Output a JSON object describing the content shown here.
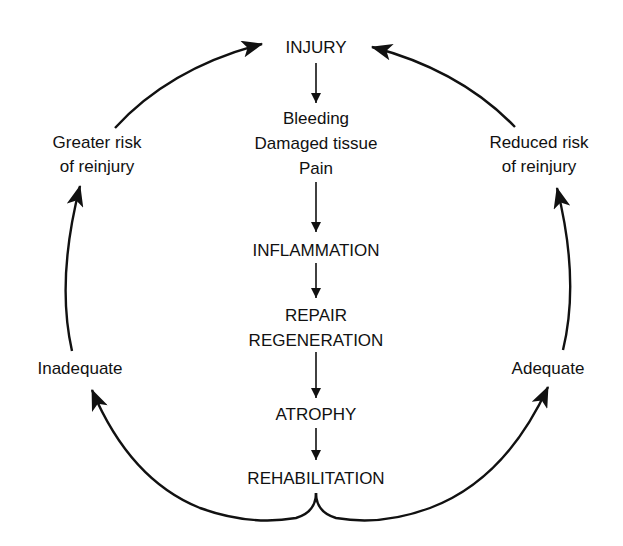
{
  "diagram": {
    "type": "cycle-flowchart",
    "colors": {
      "line": "#111111",
      "text": "#111111",
      "background": "#ffffff"
    },
    "center_flow": [
      {
        "id": "injury",
        "lines": [
          "INJURY"
        ]
      },
      {
        "id": "effects",
        "lines": [
          "Bleeding",
          "Damaged tissue",
          "Pain"
        ]
      },
      {
        "id": "inflammation",
        "lines": [
          "INFLAMMATION"
        ]
      },
      {
        "id": "repair",
        "lines": [
          "REPAIR",
          "REGENERATION"
        ]
      },
      {
        "id": "atrophy",
        "lines": [
          "ATROPHY"
        ]
      },
      {
        "id": "rehabilitation",
        "lines": [
          "REHABILITATION"
        ]
      }
    ],
    "left_branch": {
      "outcome": "Inadequate",
      "risk": [
        "Greater risk",
        "of reinjury"
      ]
    },
    "right_branch": {
      "outcome": "Adequate",
      "risk": [
        "Reduced risk",
        "of reinjury"
      ]
    },
    "edges": [
      {
        "from": "injury",
        "to": "effects"
      },
      {
        "from": "effects",
        "to": "inflammation"
      },
      {
        "from": "inflammation",
        "to": "repair"
      },
      {
        "from": "repair",
        "to": "atrophy"
      },
      {
        "from": "atrophy",
        "to": "rehabilitation"
      },
      {
        "from": "rehabilitation",
        "to": "Inadequate"
      },
      {
        "from": "Inadequate",
        "to": "Greater risk of reinjury"
      },
      {
        "from": "Greater risk of reinjury",
        "to": "injury"
      },
      {
        "from": "rehabilitation",
        "to": "Adequate"
      },
      {
        "from": "Adequate",
        "to": "Reduced risk of reinjury"
      },
      {
        "from": "Reduced risk of reinjury",
        "to": "injury"
      }
    ]
  }
}
